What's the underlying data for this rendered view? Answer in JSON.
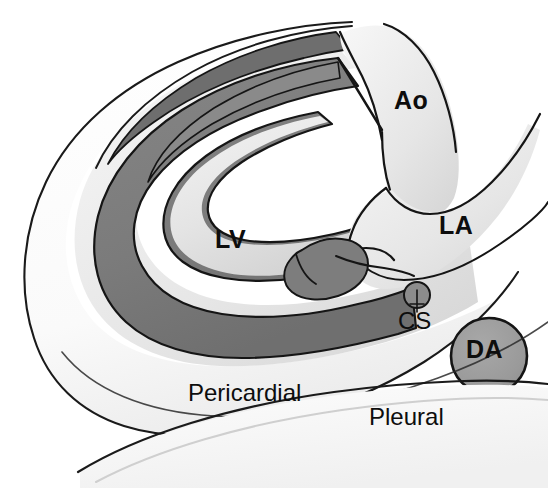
{
  "figure": {
    "kind": "anatomical-diagram",
    "background_color": "#ffffff",
    "ink_color": "#111111"
  },
  "palette": {
    "myocardium_gray": "#7d7d7d",
    "da_gray": "#9b9b9b",
    "cavity_light": "#e8e8e8",
    "pericardial_space": "#fcfcfc",
    "outline": "#101010"
  },
  "labels": {
    "aorta": "Ao",
    "left_atrium": "LA",
    "left_ventricle": "LV",
    "coronary_sinus": "CS",
    "descending_aorta": "DA",
    "pericardial": "Pericardial",
    "pleural": "Pleural"
  },
  "structures": [
    {
      "abbrev": "Ao",
      "name": "Aorta",
      "fill": "light",
      "label_position": {
        "x": 394,
        "y": 88
      }
    },
    {
      "abbrev": "LA",
      "name": "Left atrium",
      "fill": "light",
      "label_position": {
        "x": 439,
        "y": 213
      }
    },
    {
      "abbrev": "LV",
      "name": "Left ventricle",
      "fill": "light",
      "label_position": {
        "x": 215,
        "y": 227
      }
    },
    {
      "abbrev": "CS",
      "name": "Coronary sinus",
      "fill": "gray",
      "label_position": {
        "x": 398,
        "y": 309
      }
    },
    {
      "abbrev": "DA",
      "name": "Descending aorta",
      "fill": "gray",
      "label_position": {
        "x": 466,
        "y": 337
      }
    }
  ],
  "spaces": [
    {
      "name": "Pericardial",
      "label_position": {
        "x": 188,
        "y": 381
      }
    },
    {
      "name": "Pleural",
      "label_position": {
        "x": 369,
        "y": 405
      }
    }
  ]
}
